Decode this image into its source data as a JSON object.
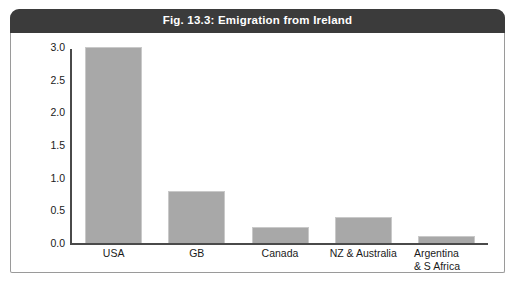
{
  "figure": {
    "title": "Fig. 13.3: Emigration from Ireland",
    "title_band_color": "#3b3b3b",
    "title_text_color": "#ffffff",
    "frame_border_color": "#9a9a9a"
  },
  "chart_data": {
    "type": "bar",
    "title": "Fig. 13.3: Emigration from Ireland",
    "xlabel": "",
    "ylabel": "numbers in 000000s",
    "categories": [
      "USA",
      "GB",
      "Canada",
      "NZ & Australia",
      "Argentina & S Africa"
    ],
    "category_lines": [
      [
        "USA"
      ],
      [
        "GB"
      ],
      [
        "Canada"
      ],
      [
        "NZ & Australia"
      ],
      [
        "Argentina",
        "& S Africa"
      ]
    ],
    "values": [
      3.0,
      0.8,
      0.25,
      0.4,
      0.1
    ],
    "ylim": [
      0.0,
      3.0
    ],
    "yticks": [
      0.0,
      0.5,
      1.0,
      1.5,
      2.0,
      2.5,
      3.0
    ],
    "ytick_labels": [
      "0.0",
      "0.5",
      "1.0",
      "1.5",
      "2.0",
      "2.5",
      "3.0"
    ],
    "grid": false,
    "legend": null,
    "bar_color": "#a8a8a8",
    "bar_edge_color": "#c9c9c9",
    "axis_color": "#4a4a4a"
  }
}
